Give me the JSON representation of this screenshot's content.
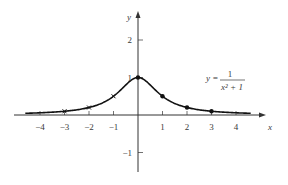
{
  "chart_data": {
    "type": "line",
    "title": "",
    "equation": {
      "lhs": "y =",
      "numerator": "1",
      "denominator": "x² + 1"
    },
    "xlabel": "x",
    "ylabel": "y",
    "xlim": [
      -4.9,
      5.1
    ],
    "ylim": [
      -1.4,
      2.7
    ],
    "x_ticks": [
      -4,
      -3,
      -2,
      -1,
      1,
      2,
      3,
      4
    ],
    "x_tick_labels": [
      "−4",
      "−3",
      "−2",
      "−1",
      "1",
      "2",
      "3",
      "4"
    ],
    "y_ticks": [
      -1,
      1,
      2
    ],
    "y_tick_labels": [
      "−1",
      "1",
      "2"
    ],
    "grid": false,
    "series": [
      {
        "name": "y = 1/(x² + 1)",
        "function": "1/(x^2+1)",
        "x_range": [
          -4.6,
          4.6
        ],
        "color": "#111111"
      }
    ],
    "marked_points": [
      {
        "x": -3,
        "y": 0.1,
        "marker": "x"
      },
      {
        "x": -2,
        "y": 0.2,
        "marker": "x"
      },
      {
        "x": -1,
        "y": 0.5,
        "marker": "x"
      },
      {
        "x": 0,
        "y": 1.0,
        "marker": "dot"
      },
      {
        "x": 1,
        "y": 0.5,
        "marker": "dot"
      },
      {
        "x": 2,
        "y": 0.2,
        "marker": "dot"
      },
      {
        "x": 3,
        "y": 0.1,
        "marker": "dot"
      }
    ]
  },
  "colors": {
    "axis": "#333333",
    "curve": "#111111",
    "text": "#3a3a3a"
  }
}
